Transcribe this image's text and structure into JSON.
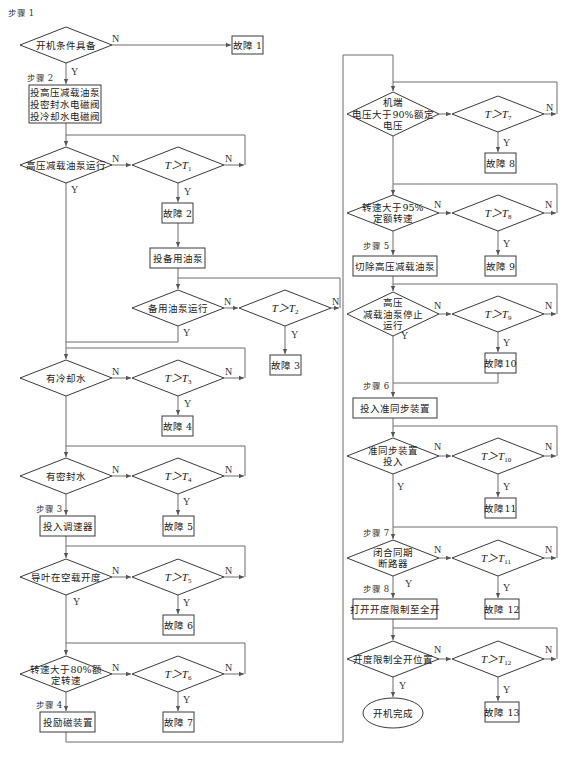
{
  "diagram": {
    "type": "flowchart",
    "steps": {
      "s1": "步骤 1",
      "s2": "步骤 2",
      "s3": "步骤 3",
      "s4": "步骤 4",
      "s5": "步骤 5",
      "s6": "步骤 6",
      "s7": "步骤 7",
      "s8": "步骤 8"
    },
    "decisions": {
      "d1": "开机条件具备",
      "d2": "高压减载油泵运行",
      "d3": "备用油泵运行",
      "d4": "有冷却水",
      "d5": "有密封水",
      "d6": "导叶在空载开度",
      "d7_l1": "转速大于80%额",
      "d7_l2": "定转速",
      "d8_l1": "机端",
      "d8_l2": "电压大于90%额定",
      "d8_l3": "电压",
      "d9_l1": "转速大于95%",
      "d9_l2": "定额转速",
      "d10_l1": "高压",
      "d10_l2": "减载油泵停止",
      "d10_l3": "运行",
      "d11_l1": "准同步装置",
      "d11_l2": "投入",
      "d12_l1": "闭合同期",
      "d12_l2": "断路器",
      "d13": "开度限制全开位置"
    },
    "timers": {
      "prefix": "T＞T",
      "t1": "1",
      "t2": "2",
      "t3": "3",
      "t4": "4",
      "t5": "5",
      "t6": "6",
      "t7": "7",
      "t8": "8",
      "t9": "9",
      "t10": "10",
      "t11": "11",
      "t12": "12"
    },
    "processes": {
      "p1_l1": "投高压减载油泵",
      "p1_l2": "投密封水电磁阀",
      "p1_l3": "投冷却水电磁阀",
      "p2": "投备用油泵",
      "p3": "投入调速器",
      "p4": "投励磁装置",
      "p5": "切除高压减载油泵",
      "p6": "投入准同步装置",
      "p7": "打开开度限制至全开"
    },
    "faults": {
      "f1": "故障 1",
      "f2": "故障 2",
      "f3": "故障 3",
      "f4": "故障 4",
      "f5": "故障 5",
      "f6": "故障 6",
      "f7": "故障 7",
      "f8": "故障 8",
      "f9": "故障 9",
      "f10": "故障10",
      "f11": "故障11",
      "f12": "故障 12",
      "f13": "故障 13"
    },
    "terminal": "开机完成",
    "yes": "Y",
    "no": "N"
  }
}
